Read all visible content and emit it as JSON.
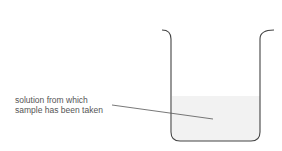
{
  "diagram": {
    "label_lines": [
      "solution from which",
      "sample has been taken"
    ],
    "colors": {
      "beaker_outline": "#444444",
      "liquid_fill": "#f2f2f2",
      "leader_line": "#555555",
      "text": "#555555"
    }
  }
}
